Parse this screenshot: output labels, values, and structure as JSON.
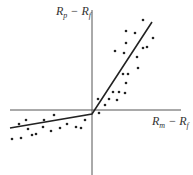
{
  "chart_data": {
    "type": "scatter",
    "title": "",
    "xlabel": "Rm − Rf",
    "ylabel": "Rp − Rf",
    "axes": {
      "origin_px": [
        92,
        110
      ],
      "x_range_px": [
        10,
        181
      ],
      "y_range_px": [
        10,
        175
      ]
    },
    "grid": false,
    "legend": null,
    "labels": {
      "y": {
        "main1": "R",
        "sub1": "p",
        "sep": " − ",
        "main2": "R",
        "sub2": "f"
      },
      "x": {
        "main1": "R",
        "sub1": "m",
        "sep": " − ",
        "main2": "R",
        "sub2": "f"
      }
    },
    "series": [
      {
        "name": "observations",
        "points_px": [
          [
            143,
            20
          ],
          [
            126,
            31
          ],
          [
            135,
            33
          ],
          [
            153,
            38
          ],
          [
            126,
            43
          ],
          [
            115,
            51
          ],
          [
            124,
            53
          ],
          [
            143,
            48
          ],
          [
            147,
            47
          ],
          [
            137,
            57
          ],
          [
            138,
            68
          ],
          [
            123,
            74
          ],
          [
            128,
            74
          ],
          [
            126,
            83
          ],
          [
            113,
            92
          ],
          [
            119,
            92
          ],
          [
            125,
            93
          ],
          [
            117,
            100
          ],
          [
            98,
            99
          ],
          [
            109,
            99
          ],
          [
            105,
            105
          ],
          [
            99,
            113
          ],
          [
            19,
            124
          ],
          [
            26,
            120
          ],
          [
            28,
            129
          ],
          [
            12,
            139
          ],
          [
            21,
            138
          ],
          [
            32,
            135
          ],
          [
            36,
            134
          ],
          [
            43,
            127
          ],
          [
            44,
            120
          ],
          [
            54,
            115
          ],
          [
            51,
            131
          ],
          [
            60,
            128
          ],
          [
            67,
            124
          ],
          [
            76,
            127
          ],
          [
            81,
            128
          ],
          [
            85,
            120
          ]
        ]
      },
      {
        "name": "fitted piecewise line",
        "type": "line",
        "points_px": [
          [
            10,
            128
          ],
          [
            92,
            114
          ],
          [
            152,
            22
          ]
        ]
      }
    ]
  }
}
